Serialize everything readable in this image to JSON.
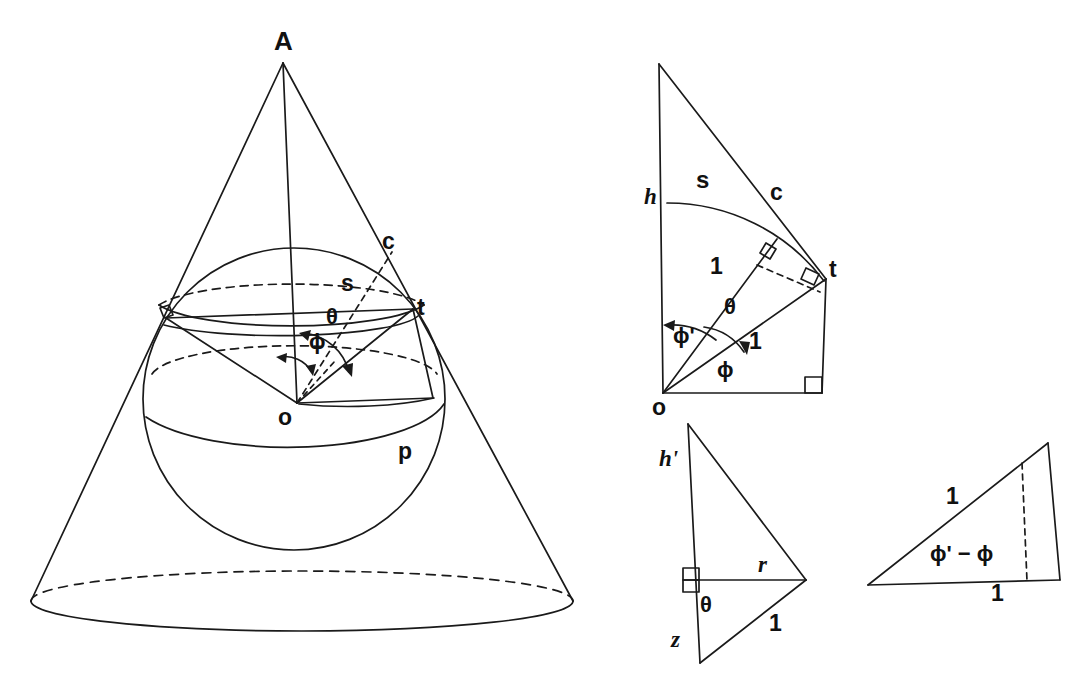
{
  "figure": {
    "stroke_color": "#1a1a1a",
    "background_color": "#ffffff"
  },
  "cone_sphere": {
    "name": "cone-sphere-diagram",
    "labels": {
      "apex": "A",
      "contact_c": "c",
      "arc_s": "s",
      "tangent_t": "t",
      "theta": "θ",
      "phi": "ϕ",
      "center_o": "o",
      "point_p": "p"
    }
  },
  "triangle_top_right": {
    "name": "unfolded-sector-diagram",
    "labels": {
      "h": "h",
      "s": "s",
      "c": "c",
      "t": "t",
      "one_upper": "1",
      "theta": "θ",
      "one_lower": "1",
      "phi_prime": "ϕ'",
      "phi": "ϕ",
      "o": "o"
    }
  },
  "triangle_bottom_middle": {
    "name": "height-radius-triangle",
    "labels": {
      "h_prime": "h'",
      "r": "r",
      "theta": "θ",
      "one": "1",
      "z": "z"
    }
  },
  "triangle_bottom_right": {
    "name": "phi-difference-triangle",
    "labels": {
      "one_slant": "1",
      "phi_diff": "ϕ' − ϕ",
      "one_base": "1"
    }
  }
}
